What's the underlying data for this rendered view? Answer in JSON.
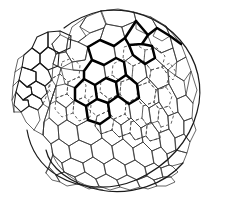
{
  "figure": {
    "background_color": "#ffffff",
    "line_color": "#1a1a1a",
    "highlight_color": "#000000",
    "hidden_edge_color": "#555555",
    "caption": "",
    "labels": [],
    "axis_labels": [],
    "legend": []
  },
  "diagram": {
    "type": "polygonal-mesh-sphere",
    "projection": "orthographic",
    "center": {
      "x": 118,
      "y": 100
    },
    "radius_x": 96,
    "radius_y": 88,
    "polygon_kinds": [
      "hexagon",
      "pentagon"
    ],
    "stroke_styles": {
      "front_solid": "solid thin black",
      "silhouette": "solid black",
      "highlight_band": "solid bold black",
      "back_surface": "dashed grey"
    },
    "features": [
      {
        "name": "open-flap",
        "description": "protruding open lid / aperture panel on the upper-left",
        "x": 18,
        "y": 40,
        "width": 60,
        "height": 60
      },
      {
        "name": "highlight-band",
        "description": "bold outlined ring of polygons across the upper middle",
        "x": 70,
        "y": 25,
        "width": 75,
        "height": 90
      },
      {
        "name": "hidden-back-faces",
        "description": "dashed polygons showing the far interior surface",
        "x": 85,
        "y": 55,
        "width": 100,
        "height": 100
      },
      {
        "name": "bottom-rim",
        "description": "doubled arc of the lower silhouette showing wall thickness",
        "x": 35,
        "y": 155,
        "width": 155,
        "height": 40
      }
    ],
    "counts": {
      "visible_front_faces": 84,
      "dashed_back_faces": 22,
      "highlighted_faces": 9
    }
  }
}
